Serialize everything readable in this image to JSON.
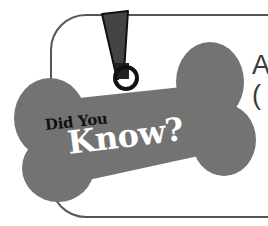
{
  "callout": {
    "badge_line1": "Did You",
    "badge_line2": "Know?",
    "heading_fragment_line1": "A",
    "heading_fragment_line2": "("
  },
  "colors": {
    "bone": "#737373",
    "tag": "#444444",
    "frame": "#555555",
    "badge_line1_text": "#111111",
    "badge_line2_text": "#ffffff",
    "background": "#ffffff"
  },
  "icons": {
    "bone": "dog-bone-tag-icon",
    "tag": "hanging-tag-icon",
    "ring": "ring-icon"
  }
}
